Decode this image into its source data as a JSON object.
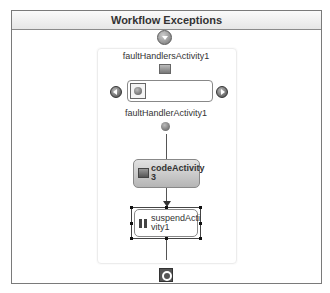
{
  "header": {
    "title": "Workflow Exceptions"
  },
  "fault_handlers": {
    "label": "faultHandlersActivity1",
    "handler_label": "faultHandlerActivity1"
  },
  "activities": [
    {
      "name": "codeActivity3",
      "line1": "codeActivity",
      "line2": "3",
      "type": "code"
    },
    {
      "name": "suspendActivity1",
      "line1": "suspendActi",
      "line2": "vity1",
      "type": "suspend",
      "selected": true
    }
  ],
  "colors": {
    "border": "#7a7a7a",
    "code_fill": "#c8c8c8",
    "connector": "#555555"
  }
}
